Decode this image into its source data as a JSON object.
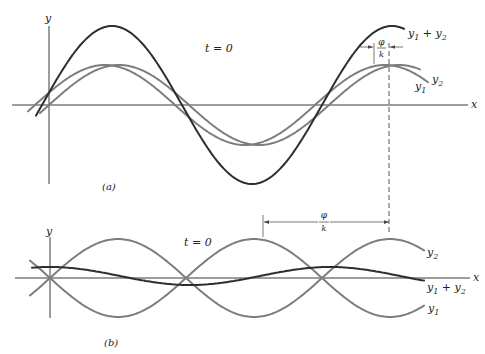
{
  "figure": {
    "panel_a": {
      "caption": "(a)",
      "time_label": "t = 0",
      "y_axis_label": "y",
      "x_axis_label": "x",
      "curve_labels": {
        "y1": "y",
        "y1_sub": "1",
        "y2": "y",
        "y2_sub": "2",
        "sum": "y",
        "sum_sub1": "1",
        "sum_plus": " + ",
        "sum_y": "y",
        "sum_sub2": "2"
      },
      "phase_label_num": "φ",
      "phase_label_den": "k"
    },
    "panel_b": {
      "caption": "(b)",
      "time_label": "t = 0",
      "y_axis_label": "y",
      "x_axis_label": "x",
      "curve_labels": {
        "y1": "y",
        "y1_sub": "1",
        "y2": "y",
        "y2_sub": "2",
        "sum": "y",
        "sum_sub1": "1",
        "sum_plus": " + ",
        "sum_y": "y",
        "sum_sub2": "2"
      },
      "phase_label_num": "φ",
      "phase_label_den": "k"
    }
  },
  "chart_data": [
    {
      "type": "line",
      "title": "(a) Superposition of two waves with small phase difference, t = 0",
      "xlabel": "x",
      "ylabel": "y",
      "origin_px": [
        49,
        105
      ],
      "period_px": 280,
      "x_range_px": [
        25,
        405
      ],
      "series": [
        {
          "name": "y1",
          "amplitude_px": 40,
          "phase_offset_px": 0,
          "style": "light"
        },
        {
          "name": "y2",
          "amplitude_px": 40,
          "phase_offset_px": 14,
          "style": "light"
        },
        {
          "name": "y1 + y2",
          "amplitude_px": 79,
          "phase_offset_px": 7,
          "style": "dark"
        }
      ],
      "annotations": [
        "t = 0",
        "φ/k marks horizontal shift between y1 and y2 peaks"
      ]
    },
    {
      "type": "line",
      "title": "(b) Superposition of two waves nearly out of phase, t = 0",
      "xlabel": "x",
      "ylabel": "y",
      "origin_px": [
        50,
        278
      ],
      "period_px": 272,
      "x_range_px": [
        30,
        425
      ],
      "series": [
        {
          "name": "y2",
          "amplitude_px": 39,
          "peaks_at_px": [
            118,
            390
          ],
          "style": "light"
        },
        {
          "name": "y1",
          "amplitude_px": 39,
          "troughs_at_px": [
            118,
            390
          ],
          "style": "light"
        },
        {
          "name": "y1 + y2",
          "amplitude_px": 9,
          "peaks_at_px": [
            50,
            330
          ],
          "style": "dark"
        }
      ],
      "annotations": [
        "t = 0",
        "φ/k spans from y1 peak (~263) to y2 peak (~390)"
      ]
    }
  ]
}
